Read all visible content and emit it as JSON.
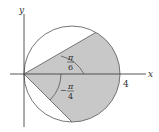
{
  "diagram": {
    "type": "polar-region",
    "curve": "r = 4cos(theta) circle",
    "axes": {
      "x_label": "x",
      "y_label": "y",
      "x_tick": "4"
    },
    "angles": {
      "upper": {
        "numerator": "π",
        "denominator": "6"
      },
      "lower": {
        "sign": "−",
        "numerator": "π",
        "denominator": "4"
      }
    },
    "colors": {
      "shade": "#c8c8c8",
      "stroke": "#555555",
      "axis": "#444444"
    }
  }
}
